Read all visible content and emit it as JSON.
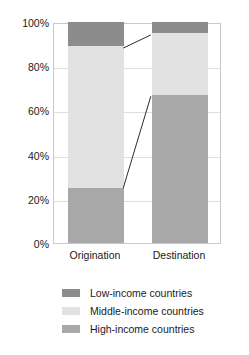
{
  "chart_data": {
    "type": "bar",
    "stacked": true,
    "normalized_percent": true,
    "title": "",
    "subtitle": "",
    "xlabel": "",
    "ylabel": "",
    "categories": [
      "Origination",
      "Destination"
    ],
    "series": [
      {
        "name": "High-income countries",
        "values": [
          25,
          67
        ],
        "color": "#a8a8a8"
      },
      {
        "name": "Middle-income countries",
        "values": [
          64,
          28
        ],
        "color": "#e2e2e2"
      },
      {
        "name": "Low-income countries",
        "values": [
          11,
          5
        ],
        "color": "#8c8c8c"
      }
    ],
    "stack_order_bottom_to_top": [
      "High-income countries",
      "Middle-income countries",
      "Low-income countries"
    ],
    "ylim": [
      0,
      100
    ],
    "yticks": [
      0,
      20,
      40,
      60,
      80,
      100
    ],
    "ytick_labels": [
      "0%",
      "20%",
      "40%",
      "60%",
      "80%",
      "100%"
    ],
    "grid": true,
    "grid_axis": "y",
    "legend_position": "bottom",
    "connectors": [
      {
        "name": "high-income-connector",
        "from_category": "Origination",
        "to_category": "Destination",
        "from_value": 25,
        "to_value": 67
      },
      {
        "name": "middle-income-connector",
        "from_category": "Origination",
        "to_category": "Destination",
        "from_value": 89,
        "to_value": 95
      }
    ]
  },
  "axes": {
    "y_ticks": [
      {
        "label": "100%",
        "value": 100
      },
      {
        "label": "80%",
        "value": 80
      },
      {
        "label": "60%",
        "value": 60
      },
      {
        "label": "40%",
        "value": 40
      },
      {
        "label": "20%",
        "value": 20
      },
      {
        "label": "0%",
        "value": 0
      }
    ],
    "x_ticks": [
      {
        "label": "Origination"
      },
      {
        "label": "Destination"
      }
    ]
  },
  "legend": {
    "items": [
      {
        "label": "Low-income countries",
        "color": "#8c8c8c"
      },
      {
        "label": "Middle-income countries",
        "color": "#e2e2e2"
      },
      {
        "label": "High-income countries",
        "color": "#a8a8a8"
      }
    ]
  },
  "colors": {
    "low_income": "#8c8c8c",
    "middle_income": "#e2e2e2",
    "high_income": "#a8a8a8",
    "plot_border": "#c9c9c9",
    "gridline": "#dedede",
    "connector_line": "#2b2b2b",
    "background": "#ffffff",
    "text": "#1a1a1a"
  }
}
